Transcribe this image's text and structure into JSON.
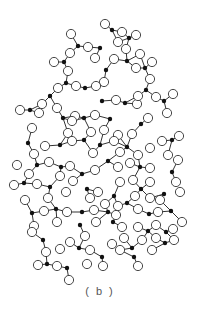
{
  "figure": {
    "label": "( b )",
    "colors": {
      "si": "#111111",
      "o_fill": "#ffffff",
      "o_stroke": "#333333",
      "bond": "#333333"
    }
  },
  "network": {
    "si": [
      [
        112,
        30
      ],
      [
        78,
        46
      ],
      [
        100,
        48
      ],
      [
        129,
        38
      ],
      [
        64,
        62
      ],
      [
        127,
        61
      ],
      [
        145,
        68
      ],
      [
        66,
        83
      ],
      [
        106,
        70
      ],
      [
        146,
        90
      ],
      [
        50,
        96
      ],
      [
        85,
        88
      ],
      [
        102,
        101
      ],
      [
        125,
        103
      ],
      [
        164,
        101
      ],
      [
        30,
        110
      ],
      [
        63,
        118
      ],
      [
        84,
        118
      ],
      [
        110,
        119
      ],
      [
        141,
        124
      ],
      [
        60,
        145
      ],
      [
        28,
        143
      ],
      [
        84,
        140
      ],
      [
        100,
        145
      ],
      [
        127,
        147
      ],
      [
        172,
        140
      ],
      [
        37,
        165
      ],
      [
        61,
        167
      ],
      [
        82,
        174
      ],
      [
        108,
        161
      ],
      [
        140,
        167
      ],
      [
        172,
        172
      ],
      [
        24,
        183
      ],
      [
        50,
        187
      ],
      [
        87,
        189
      ],
      [
        114,
        196
      ],
      [
        141,
        189
      ],
      [
        164,
        194
      ],
      [
        32,
        213
      ],
      [
        56,
        209
      ],
      [
        82,
        212
      ],
      [
        108,
        212
      ],
      [
        127,
        203
      ],
      [
        149,
        214
      ],
      [
        171,
        211
      ],
      [
        43,
        240
      ],
      [
        80,
        225
      ],
      [
        113,
        222
      ],
      [
        148,
        231
      ],
      [
        166,
        232
      ],
      [
        47,
        264
      ],
      [
        79,
        248
      ],
      [
        102,
        257
      ],
      [
        132,
        248
      ],
      [
        165,
        243
      ],
      [
        67,
        268
      ],
      [
        134,
        257
      ]
    ],
    "o": [
      [
        105,
        24
      ],
      [
        122,
        32
      ],
      [
        136,
        35
      ],
      [
        118,
        42
      ],
      [
        71,
        34
      ],
      [
        88,
        47
      ],
      [
        126,
        49
      ],
      [
        140,
        54
      ],
      [
        152,
        62
      ],
      [
        70,
        53
      ],
      [
        95,
        58
      ],
      [
        114,
        59
      ],
      [
        104,
        82
      ],
      [
        54,
        62
      ],
      [
        68,
        71
      ],
      [
        136,
        68
      ],
      [
        150,
        79
      ],
      [
        58,
        88
      ],
      [
        76,
        86
      ],
      [
        96,
        86
      ],
      [
        116,
        100
      ],
      [
        137,
        104
      ],
      [
        156,
        97
      ],
      [
        173,
        94
      ],
      [
        138,
        96
      ],
      [
        42,
        104
      ],
      [
        57,
        108
      ],
      [
        75,
        116
      ],
      [
        95,
        115
      ],
      [
        104,
        130
      ],
      [
        118,
        135
      ],
      [
        132,
        134
      ],
      [
        148,
        118
      ],
      [
        167,
        113
      ],
      [
        20,
        110
      ],
      [
        39,
        113
      ],
      [
        72,
        121
      ],
      [
        32,
        128
      ],
      [
        68,
        133
      ],
      [
        91,
        132
      ],
      [
        114,
        141
      ],
      [
        120,
        152
      ],
      [
        138,
        155
      ],
      [
        150,
        148
      ],
      [
        162,
        141
      ],
      [
        168,
        155
      ],
      [
        179,
        136
      ],
      [
        45,
        146
      ],
      [
        72,
        141
      ],
      [
        93,
        153
      ],
      [
        34,
        154
      ],
      [
        49,
        162
      ],
      [
        70,
        166
      ],
      [
        95,
        170
      ],
      [
        118,
        167
      ],
      [
        130,
        163
      ],
      [
        150,
        168
      ],
      [
        178,
        160
      ],
      [
        17,
        165
      ],
      [
        29,
        174
      ],
      [
        60,
        176
      ],
      [
        73,
        181
      ],
      [
        98,
        192
      ],
      [
        120,
        182
      ],
      [
        133,
        180
      ],
      [
        150,
        182
      ],
      [
        160,
        200
      ],
      [
        176,
        182
      ],
      [
        14,
        185
      ],
      [
        37,
        184
      ],
      [
        48,
        198
      ],
      [
        66,
        192
      ],
      [
        90,
        198
      ],
      [
        105,
        204
      ],
      [
        118,
        206
      ],
      [
        135,
        196
      ],
      [
        150,
        198
      ],
      [
        180,
        192
      ],
      [
        25,
        200
      ],
      [
        44,
        211
      ],
      [
        67,
        212
      ],
      [
        94,
        210
      ],
      [
        116,
        215
      ],
      [
        138,
        209
      ],
      [
        158,
        212
      ],
      [
        182,
        222
      ],
      [
        34,
        226
      ],
      [
        57,
        222
      ],
      [
        85,
        236
      ],
      [
        96,
        222
      ],
      [
        122,
        227
      ],
      [
        138,
        227
      ],
      [
        156,
        225
      ],
      [
        173,
        229
      ],
      [
        32,
        232
      ],
      [
        46,
        252
      ],
      [
        60,
        249
      ],
      [
        70,
        242
      ],
      [
        90,
        250
      ],
      [
        112,
        244
      ],
      [
        124,
        238
      ],
      [
        142,
        240
      ],
      [
        156,
        238
      ],
      [
        174,
        240
      ],
      [
        38,
        265
      ],
      [
        57,
        266
      ],
      [
        87,
        264
      ],
      [
        103,
        266
      ],
      [
        120,
        250
      ],
      [
        138,
        266
      ],
      [
        152,
        250
      ],
      [
        69,
        280
      ]
    ]
  }
}
